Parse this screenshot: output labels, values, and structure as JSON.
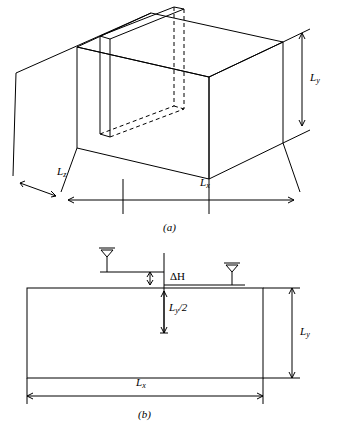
{
  "figure": {
    "title": "",
    "panels": [
      {
        "id": "a",
        "caption": "(a)",
        "type": "3d-block-with-vertical-slice",
        "labels": [
          {
            "name": "Ly",
            "base": "L",
            "sub": "y",
            "suffix": ""
          },
          {
            "name": "Lz",
            "base": "L",
            "sub": "z",
            "suffix": ""
          },
          {
            "name": "Lx",
            "base": "L",
            "sub": "x",
            "suffix": ""
          }
        ]
      },
      {
        "id": "b",
        "caption": "(b)",
        "type": "2d-cross-section",
        "labels": [
          {
            "name": "deltaH",
            "base": "ΔH",
            "sub": "",
            "suffix": ""
          },
          {
            "name": "Ly_half",
            "base": "L",
            "sub": "y",
            "suffix": "/2"
          },
          {
            "name": "Ly",
            "base": "L",
            "sub": "y",
            "suffix": ""
          },
          {
            "name": "Lx",
            "base": "L",
            "sub": "x",
            "suffix": ""
          }
        ]
      }
    ],
    "colors": {
      "stroke": "#000000",
      "background": "#ffffff"
    }
  },
  "panel_a": {
    "caption": "(a)",
    "label_ly": {
      "base": "L",
      "sub": "y"
    },
    "label_lz": {
      "base": "L",
      "sub": "z"
    },
    "label_lx": {
      "base": "L",
      "sub": "x"
    }
  },
  "panel_b": {
    "caption": "(b)",
    "label_dh": "ΔH",
    "label_lyhalf": {
      "base": "L",
      "sub": "y",
      "suffix": "/2"
    },
    "label_ly": {
      "base": "L",
      "sub": "y"
    },
    "label_lx": {
      "base": "L",
      "sub": "x"
    }
  }
}
